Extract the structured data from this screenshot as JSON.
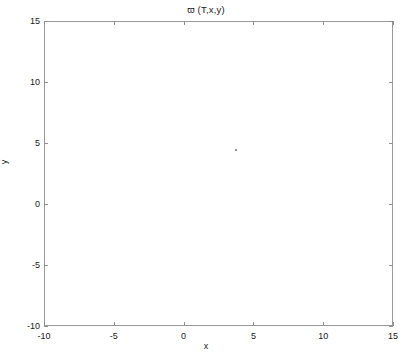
{
  "figure": {
    "width": 412,
    "height": 361,
    "background": "#ffffff",
    "line_color": "#6a6a6a",
    "frame_color": "#9a9a9a",
    "text_color": "#1a1a1a"
  },
  "chart_data": {
    "type": "line",
    "plot_kind": "contour",
    "title": "ϖ (T,x,y)",
    "xlabel": "x",
    "ylabel": "y",
    "xlim": [
      -10,
      15
    ],
    "ylim": [
      -10,
      15
    ],
    "xticks": [
      -10,
      -5,
      0,
      5,
      10,
      15
    ],
    "yticks": [
      -10,
      -5,
      0,
      5,
      10,
      15
    ],
    "xticklabels": [
      "-10",
      "-5",
      "0",
      "5",
      "10",
      "15"
    ],
    "yticklabels": [
      "-10",
      "-5",
      "0",
      "5",
      "10",
      "15"
    ],
    "grid": false,
    "legend": null,
    "contour": {
      "center": [
        2.0,
        2.1
      ],
      "rotation_deg": 51,
      "semi_major_outer": 14.6,
      "semi_minor_outer": 4.35,
      "n_levels": 46,
      "level_shape": "gaussian",
      "spacing": "exponential-inward",
      "inner_scale_min": 0.035,
      "outer_scale_max": 1.0,
      "level_values": [
        0.02,
        0.04,
        0.06,
        0.08,
        0.1,
        0.13,
        0.16,
        0.19,
        0.22,
        0.26,
        0.3,
        0.34,
        0.38,
        0.42,
        0.46,
        0.5,
        0.54,
        0.58,
        0.62,
        0.65,
        0.68,
        0.71,
        0.74,
        0.77,
        0.79,
        0.81,
        0.83,
        0.85,
        0.87,
        0.885,
        0.9,
        0.912,
        0.924,
        0.934,
        0.944,
        0.952,
        0.96,
        0.967,
        0.973,
        0.978,
        0.983,
        0.987,
        0.99,
        0.993,
        0.996,
        0.998
      ],
      "extent_notes": {
        "outer_lowest_y": -8.8,
        "outer_highest_y": 13.2,
        "outer_leftmost_x": -7.0,
        "outer_rightmost_x": 12.6
      }
    },
    "markers": [
      {
        "x": 3.7,
        "y": 4.5,
        "name": "core-speck"
      }
    ]
  }
}
